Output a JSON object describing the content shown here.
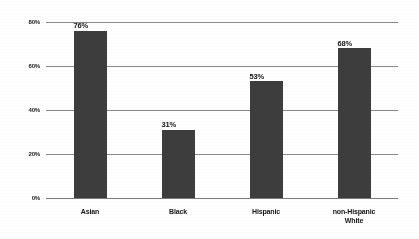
{
  "chart_data": {
    "type": "bar",
    "title": "",
    "subtitle": "",
    "xlabel": "",
    "ylabel": "",
    "categories": [
      "Asian",
      "Black",
      "Hispanic",
      "non-Hispanic White"
    ],
    "category_lines": [
      [
        "Asian"
      ],
      [
        "Black"
      ],
      [
        "Hispanic"
      ],
      [
        "non-Hispanic",
        "White"
      ]
    ],
    "values": [
      76,
      31,
      53,
      68
    ],
    "data_labels": [
      "76%",
      "31%",
      "53%",
      "68%"
    ],
    "ylim": [
      0,
      80
    ],
    "yticks": [
      0,
      20,
      40,
      60,
      80
    ],
    "ytick_labels": [
      "0%",
      "20%",
      "40%",
      "60%",
      "80%"
    ],
    "grid": true,
    "grid_axis": "y",
    "legend": false,
    "legend_position": "none",
    "bar_color": "#3d3d3d",
    "grid_color": "#8a8a8a",
    "background_color": "#ffffff",
    "text_color": "#141414"
  }
}
